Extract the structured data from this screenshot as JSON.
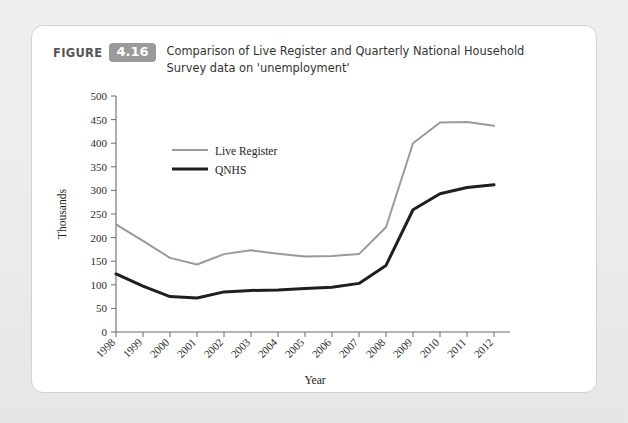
{
  "figure": {
    "label": "FIGURE",
    "number": "4.16",
    "caption": "Comparison of Live Register and Quarterly National Household Survey data on 'unemployment'"
  },
  "chart_data": {
    "type": "line",
    "title": "Comparison of Live Register and Quarterly National Household Survey data on 'unemployment'",
    "xlabel": "Year",
    "ylabel": "Thousands",
    "categories": [
      "1998",
      "1999",
      "2000",
      "2001",
      "2002",
      "2003",
      "2004",
      "2005",
      "2006",
      "2007",
      "2008",
      "2009",
      "2010",
      "2011",
      "2012"
    ],
    "ylim": [
      0,
      500
    ],
    "yticks": [
      0,
      50,
      100,
      150,
      200,
      250,
      300,
      350,
      400,
      450,
      500
    ],
    "grid": false,
    "legend_position": "upper-left-inside",
    "series": [
      {
        "name": "Live Register",
        "color": "#9a9a9a",
        "width": 2.0,
        "values": [
          228,
          193,
          157,
          143,
          165,
          173,
          166,
          160,
          161,
          165,
          222,
          400,
          444,
          445,
          437
        ]
      },
      {
        "name": "QNHS",
        "color": "#1f1f1f",
        "width": 3.0,
        "values": [
          123,
          97,
          75,
          72,
          85,
          88,
          89,
          92,
          95,
          103,
          141,
          259,
          293,
          306,
          312
        ]
      }
    ]
  },
  "colors": {
    "page_background": "#ebebeb",
    "card_background": "#ffffff",
    "badge": "#9a9a9a",
    "axis": "#6b6b6b",
    "text": "#1c1c1c"
  }
}
